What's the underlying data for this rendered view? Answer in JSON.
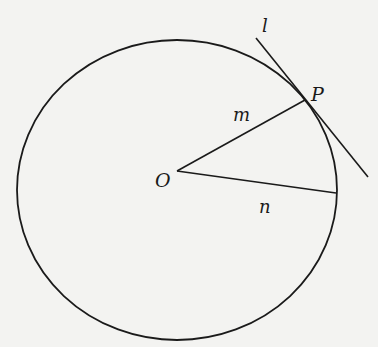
{
  "diagram": {
    "type": "geometry",
    "colors": {
      "background": "#f3f3f1",
      "stroke": "#1a1a1a"
    },
    "circle": {
      "cx": 177,
      "cy": 190,
      "r": 160
    },
    "points": {
      "O": {
        "label": "O",
        "x": 177,
        "y": 171
      },
      "P": {
        "label": "P",
        "x": 305,
        "y": 100
      },
      "N_end": {
        "x": 336,
        "y": 193
      }
    },
    "segments": {
      "m": {
        "label": "m"
      },
      "n": {
        "label": "n"
      }
    },
    "tangent": {
      "label": "l"
    }
  }
}
